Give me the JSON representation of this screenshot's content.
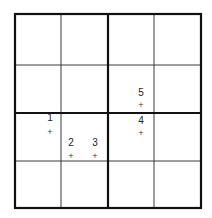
{
  "diagram": {
    "type": "grid",
    "rows": 4,
    "cols": 4,
    "thick_divisions": "2x2 quadrants",
    "colors": {
      "line": "#111111",
      "thin_line": "#3a3a3a",
      "text": "#222222",
      "background": "#ffffff"
    },
    "points": [
      {
        "label": "1",
        "marker": "+",
        "x": 50,
        "y": 131,
        "label_y": 121
      },
      {
        "label": "2",
        "marker": "+",
        "x": 71,
        "y": 155,
        "label_y": 146
      },
      {
        "label": "3",
        "marker": "+",
        "x": 95,
        "y": 155,
        "label_y": 146
      },
      {
        "label": "4",
        "marker": "+",
        "x": 141,
        "y": 132,
        "label_y": 124
      },
      {
        "label": "5",
        "marker": "+",
        "x": 141,
        "y": 104,
        "label_y": 96
      }
    ]
  }
}
